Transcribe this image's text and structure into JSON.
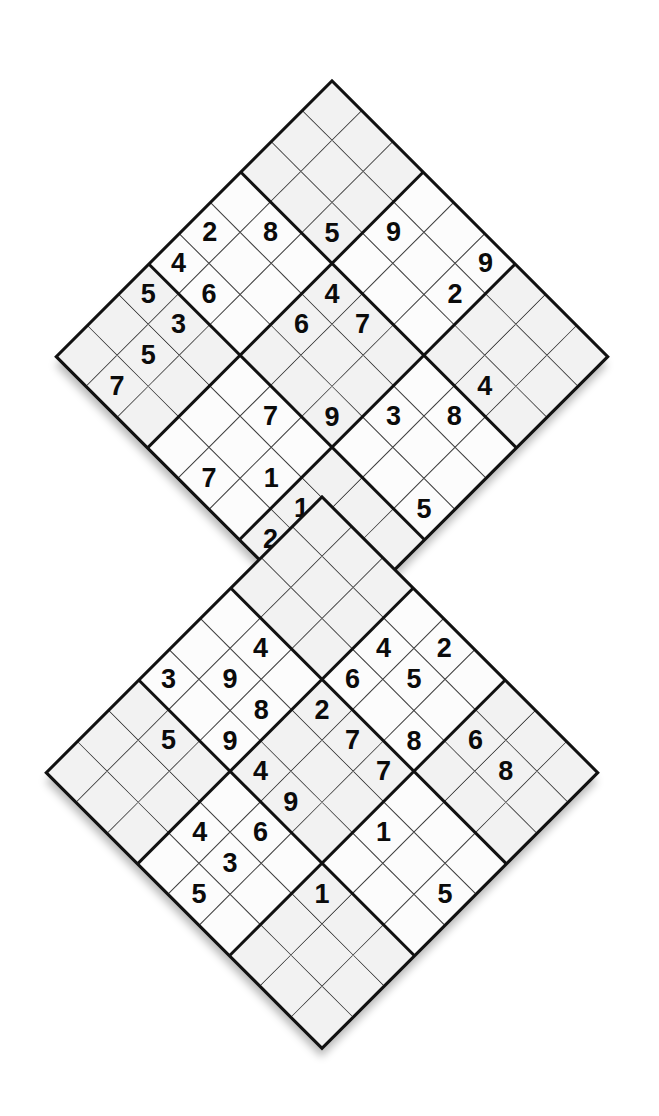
{
  "puzzle": {
    "title": "Butterfly Sudoku",
    "type": "samurai-sudoku",
    "orientation": "diamond-45deg",
    "grid_count": 2,
    "grid_size": 9,
    "overlap_blocks": 1,
    "colors": {
      "page_background": "#ffffff",
      "cell_background": "#fcfcfc",
      "shaded_cell_background": "#f2f2f2",
      "thin_line": "#3a3a3a",
      "thick_line": "#111111",
      "digit": "#0b0b0b"
    },
    "grids": [
      {
        "name": "top-grid",
        "label": "Upper diamond grid",
        "center_x": 332,
        "center_y": 356,
        "rows": [
          [
            "",
            "",
            "",
            "",
            "",
            "",
            "",
            "",
            ""
          ],
          [
            "",
            "",
            "9",
            "",
            "",
            "",
            "",
            "",
            ""
          ],
          [
            "",
            "9",
            "",
            "2",
            "",
            "",
            "",
            "",
            ""
          ],
          [
            "",
            "5",
            "",
            "",
            "",
            "4",
            "",
            "",
            ""
          ],
          [
            "8",
            "",
            "4",
            "7",
            "",
            "8",
            "",
            "",
            ""
          ],
          [
            "2",
            "",
            "6",
            "",
            "3",
            "",
            "",
            "",
            ""
          ],
          [
            "4",
            "6",
            "",
            "9",
            "",
            "",
            "",
            "5",
            ""
          ],
          [
            "5",
            "3",
            "",
            "7",
            "",
            "",
            "",
            "",
            ""
          ],
          [
            "",
            "5",
            "",
            "1",
            "1",
            "8",
            "",
            "",
            ""
          ]
        ]
      },
      {
        "name": "bottom-grid",
        "label": "Lower diamond grid",
        "center_x": 322,
        "center_y": 772,
        "rows": [
          [
            "",
            "",
            "",
            "",
            "",
            "",
            "",
            "",
            ""
          ],
          [
            "",
            "",
            "",
            "",
            "2",
            "",
            "",
            "",
            ""
          ],
          [
            "",
            "",
            "6",
            "5",
            "6",
            "8",
            "",
            "",
            ""
          ],
          [
            "4",
            "",
            "2",
            "8",
            "",
            "",
            "",
            "",
            ""
          ],
          [
            "9",
            "",
            "8",
            "7",
            "7",
            "",
            "",
            "",
            ""
          ],
          [
            "3",
            "",
            "9",
            "4",
            "1",
            "5",
            "",
            "",
            ""
          ],
          [
            "",
            "5",
            "",
            "9",
            "",
            "",
            "",
            "",
            ""
          ],
          [
            "",
            "",
            "4",
            "6",
            "1",
            "",
            "",
            "",
            ""
          ],
          [
            "",
            "",
            "1",
            "3",
            "",
            "",
            "",
            "",
            ""
          ],
          [
            "",
            "",
            "5",
            "8",
            "",
            "",
            "",
            "",
            ""
          ]
        ]
      }
    ],
    "givens_top": [
      {
        "r": 1,
        "c": 4,
        "d": "9"
      },
      {
        "r": 2,
        "c": 2,
        "d": "9"
      },
      {
        "r": 2,
        "c": 3,
        "d": "2"
      },
      {
        "r": 3,
        "c": 1,
        "d": "5"
      },
      {
        "r": 3,
        "c": 5,
        "d": "4"
      },
      {
        "r": 4,
        "c": 0,
        "d": "8"
      },
      {
        "r": 4,
        "c": 2,
        "d": "4"
      },
      {
        "r": 4,
        "c": 3,
        "d": "7"
      },
      {
        "r": 4,
        "c": 5,
        "d": "8"
      },
      {
        "r": 5,
        "c": 0,
        "d": "2"
      },
      {
        "r": 5,
        "c": 2,
        "d": "6"
      },
      {
        "r": 5,
        "c": 4,
        "d": "3"
      },
      {
        "r": 6,
        "c": 0,
        "d": "4"
      },
      {
        "r": 6,
        "c": 1,
        "d": "6"
      },
      {
        "r": 6,
        "c": 4,
        "d": "9"
      },
      {
        "r": 6,
        "c": 7,
        "d": "5"
      },
      {
        "r": 7,
        "c": 0,
        "d": "5"
      },
      {
        "r": 7,
        "c": 1,
        "d": "3"
      },
      {
        "r": 7,
        "c": 4,
        "d": "7"
      },
      {
        "r": 8,
        "c": 1,
        "d": "5"
      },
      {
        "r": 8,
        "c": 5,
        "d": "1"
      },
      {
        "r": 8,
        "c": 6,
        "d": "8"
      }
    ],
    "digits": [
      "1",
      "2",
      "3",
      "4",
      "5",
      "6",
      "7",
      "8",
      "9"
    ]
  },
  "cells_top": [
    {
      "r": 0,
      "c": 5,
      "d": "9"
    },
    {
      "r": 1,
      "c": 3,
      "d": "9"
    },
    {
      "r": 1,
      "c": 5,
      "d": "2"
    },
    {
      "r": 2,
      "c": 2,
      "d": "5"
    },
    {
      "r": 2,
      "c": 7,
      "d": "4"
    },
    {
      "r": 3,
      "c": 1,
      "d": "8"
    },
    {
      "r": 3,
      "c": 3,
      "d": "4"
    },
    {
      "r": 3,
      "c": 4,
      "d": "7"
    },
    {
      "r": 3,
      "c": 7,
      "d": "8"
    },
    {
      "r": 4,
      "c": 0,
      "d": "2"
    },
    {
      "r": 4,
      "c": 3,
      "d": "6"
    },
    {
      "r": 4,
      "c": 6,
      "d": "3"
    },
    {
      "r": 5,
      "c": 0,
      "d": "4"
    },
    {
      "r": 5,
      "c": 1,
      "d": "6"
    },
    {
      "r": 5,
      "c": 5,
      "d": "9"
    },
    {
      "r": 5,
      "c": 8,
      "d": "5"
    },
    {
      "r": 6,
      "c": 0,
      "d": "5"
    },
    {
      "r": 6,
      "c": 1,
      "d": "3"
    },
    {
      "r": 6,
      "c": 4,
      "d": "7"
    },
    {
      "r": 7,
      "c": 1,
      "d": "5"
    },
    {
      "r": 7,
      "c": 5,
      "d": "1"
    },
    {
      "r": 7,
      "c": 6,
      "d": "1"
    },
    {
      "r": 7,
      "c": 7,
      "d": "8"
    },
    {
      "r": 8,
      "c": 1,
      "d": "7"
    },
    {
      "r": 8,
      "c": 4,
      "d": "7"
    },
    {
      "r": 8,
      "c": 6,
      "d": "2"
    }
  ],
  "cells_bottom": [
    {
      "r": 0,
      "c": 4,
      "d": "2"
    },
    {
      "r": 1,
      "c": 3,
      "d": "4"
    },
    {
      "r": 1,
      "c": 4,
      "d": "5"
    },
    {
      "r": 1,
      "c": 6,
      "d": "6"
    },
    {
      "r": 1,
      "c": 7,
      "d": "8"
    },
    {
      "r": 2,
      "c": 3,
      "d": "6"
    },
    {
      "r": 2,
      "c": 5,
      "d": "8"
    },
    {
      "r": 3,
      "c": 1,
      "d": "4"
    },
    {
      "r": 3,
      "c": 3,
      "d": "2"
    },
    {
      "r": 3,
      "c": 4,
      "d": "7"
    },
    {
      "r": 3,
      "c": 5,
      "d": "7"
    },
    {
      "r": 4,
      "c": 1,
      "d": "9"
    },
    {
      "r": 4,
      "c": 2,
      "d": "8"
    },
    {
      "r": 4,
      "c": 6,
      "d": "1"
    },
    {
      "r": 4,
      "c": 8,
      "d": "5"
    },
    {
      "r": 5,
      "c": 0,
      "d": "3"
    },
    {
      "r": 5,
      "c": 2,
      "d": "9"
    },
    {
      "r": 5,
      "c": 3,
      "d": "4"
    },
    {
      "r": 5,
      "c": 4,
      "d": "9"
    },
    {
      "r": 6,
      "c": 1,
      "d": "5"
    },
    {
      "r": 6,
      "c": 4,
      "d": "6"
    },
    {
      "r": 6,
      "c": 6,
      "d": "1"
    },
    {
      "r": 7,
      "c": 3,
      "d": "4"
    },
    {
      "r": 7,
      "c": 4,
      "d": "3"
    },
    {
      "r": 8,
      "c": 4,
      "d": "5"
    },
    {
      "r": 9,
      "c": 4,
      "d": "8"
    }
  ],
  "a11y": {
    "top_grid_label": "Upper sudoku grid rotated 45 degrees",
    "bottom_grid_label": "Lower sudoku grid rotated 45 degrees"
  }
}
